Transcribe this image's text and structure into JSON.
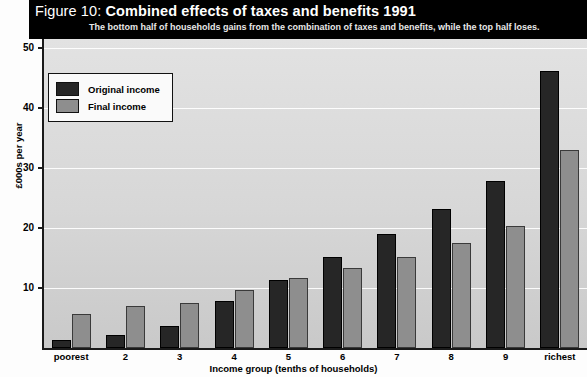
{
  "banner": {
    "figure_number": "Figure 10:",
    "title": "Combined effects of taxes and benefits 1991",
    "subtitle": "The bottom half of households gains from the combination of taxes and benefits, while the top half loses."
  },
  "legend": {
    "items": [
      {
        "label": "Original income",
        "color": "#262626"
      },
      {
        "label": "Final income",
        "color": "#8e8e8e"
      }
    ]
  },
  "axes": {
    "y_title": "£000s per year",
    "y_ticks": [
      "10",
      "20",
      "30",
      "40",
      "50"
    ],
    "x_title": "Income group (tenths of households)"
  },
  "source": "",
  "chart_data": {
    "type": "bar",
    "title": "Combined effects of taxes and benefits 1991",
    "subtitle": "The bottom half of households gains from the combination of taxes and benefits, while the top half loses.",
    "xlabel": "Income group (tenths of households)",
    "ylabel": "£000s per year",
    "ylim": [
      0,
      50
    ],
    "yticks": [
      10,
      20,
      30,
      40,
      50
    ],
    "grid": true,
    "legend_position": "top-left",
    "categories": [
      "poorest",
      "2",
      "3",
      "4",
      "5",
      "6",
      "7",
      "8",
      "9",
      "richest"
    ],
    "series": [
      {
        "name": "Original income",
        "color": "#262626",
        "values": [
          1.4,
          2.2,
          3.6,
          7.8,
          11.3,
          15.2,
          19.0,
          23.2,
          27.8,
          46.2
        ]
      },
      {
        "name": "Final income",
        "color": "#8e8e8e",
        "values": [
          5.7,
          7.0,
          7.5,
          9.6,
          11.6,
          13.3,
          15.1,
          17.5,
          20.3,
          33.0
        ]
      }
    ]
  }
}
